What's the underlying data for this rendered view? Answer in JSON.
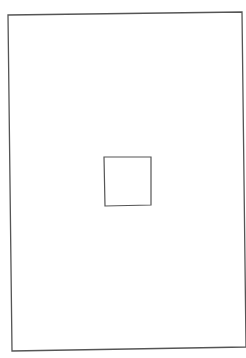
{
  "diagram": {
    "background": "#ffffff",
    "stroke_color": "#555555",
    "shapes": [
      {
        "id": "outer-rectangle",
        "type": "quadrilateral",
        "points": [
          [
            8,
            15
          ],
          [
            242,
            12
          ],
          [
            246,
            347
          ],
          [
            12,
            351
          ]
        ],
        "stroke_width": 1.3
      },
      {
        "id": "inner-square",
        "type": "quadrilateral",
        "points": [
          [
            104,
            157
          ],
          [
            151,
            157
          ],
          [
            151,
            205
          ],
          [
            105,
            206
          ]
        ],
        "stroke_width": 1.2
      }
    ]
  }
}
